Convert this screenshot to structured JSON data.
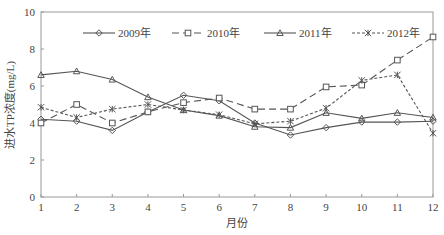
{
  "chart_data": {
    "type": "line",
    "title": "",
    "xlabel": "月份",
    "ylabel": "进水TP浓度(mg/L)",
    "categories": [
      "1",
      "2",
      "3",
      "4",
      "5",
      "6",
      "7",
      "8",
      "9",
      "10",
      "11",
      "12"
    ],
    "x": [
      1,
      2,
      3,
      4,
      5,
      6,
      7,
      8,
      9,
      10,
      11,
      12
    ],
    "xlim": [
      1,
      12
    ],
    "ylim": [
      0,
      10
    ],
    "yticks": [
      0,
      2,
      4,
      6,
      8,
      10
    ],
    "grid": false,
    "legend_position": "top-inside",
    "series": [
      {
        "name": "2009年",
        "marker": "diamond",
        "line": "solid",
        "values": [
          4.2,
          4.1,
          3.6,
          4.6,
          5.5,
          5.2,
          4.0,
          3.35,
          3.75,
          4.05,
          4.05,
          4.1
        ]
      },
      {
        "name": "2010年",
        "marker": "square",
        "line": "long-dash",
        "values": [
          4.0,
          5.0,
          4.0,
          4.6,
          5.1,
          5.35,
          4.75,
          4.75,
          5.95,
          6.05,
          7.4,
          8.65
        ]
      },
      {
        "name": "2011年",
        "marker": "triangle",
        "line": "solid",
        "values": [
          6.6,
          6.8,
          6.35,
          5.4,
          4.7,
          4.4,
          3.8,
          3.75,
          4.55,
          4.25,
          4.55,
          4.3
        ]
      },
      {
        "name": "2012年",
        "marker": "star",
        "line": "short-dash",
        "values": [
          4.85,
          4.3,
          4.75,
          5.0,
          4.7,
          4.45,
          3.95,
          4.1,
          4.8,
          6.3,
          6.6,
          3.45
        ]
      }
    ]
  },
  "colors": {
    "axis": "#999999",
    "line": "#555555"
  }
}
